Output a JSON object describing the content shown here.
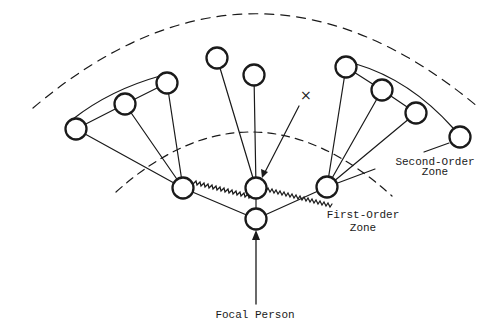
{
  "diagram": {
    "type": "social-network-zones",
    "labels": {
      "focal_person": "Focal Person",
      "first_order_line1": "First-Order",
      "first_order_line2": "Zone",
      "second_order_line1": "Second-Order",
      "second_order_line2": "Zone",
      "x_marker": "×"
    },
    "colors": {
      "ink": "#1a1a1a",
      "background": "#ffffff"
    },
    "zones": [
      {
        "name": "first-order-zone-boundary",
        "style": "dashed"
      },
      {
        "name": "second-order-zone-boundary",
        "style": "dashed"
      }
    ],
    "nodes": [
      {
        "id": "focal",
        "role": "focal person"
      },
      {
        "id": "f-left",
        "role": "first-order contact"
      },
      {
        "id": "f-center",
        "role": "first-order contact"
      },
      {
        "id": "f-right",
        "role": "first-order contact"
      },
      {
        "id": "s-left-1",
        "role": "second-order contact"
      },
      {
        "id": "s-left-2",
        "role": "second-order contact"
      },
      {
        "id": "s-left-3",
        "role": "second-order contact"
      },
      {
        "id": "s-mid-1",
        "role": "second-order contact"
      },
      {
        "id": "s-mid-2",
        "role": "second-order contact"
      },
      {
        "id": "s-right-1",
        "role": "second-order contact"
      },
      {
        "id": "s-right-2",
        "role": "second-order contact"
      },
      {
        "id": "s-right-3",
        "role": "second-order contact"
      },
      {
        "id": "s-right-4",
        "role": "second-order contact"
      }
    ],
    "edge_types": [
      "plain tie",
      "zigzag tie (between first-order contacts)",
      "arrow"
    ]
  }
}
